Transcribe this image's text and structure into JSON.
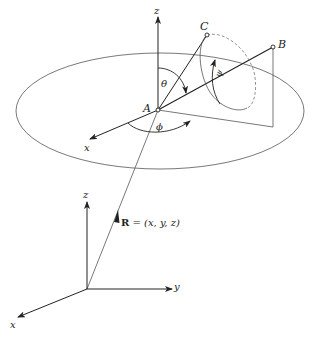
{
  "diagram": {
    "upper_frame": {
      "axis_z_label": "z",
      "axis_x_label": "x",
      "point_A": "A",
      "point_B": "B",
      "point_C": "C",
      "angle_theta": "θ",
      "angle_phi": "ϕ",
      "angle_psi": "ψ"
    },
    "lower_frame": {
      "axis_z_label": "z",
      "axis_y_label": "y",
      "axis_x_label": "x",
      "position_vector_bold": "R",
      "position_vector_rest": " = (x, y, z)"
    }
  }
}
